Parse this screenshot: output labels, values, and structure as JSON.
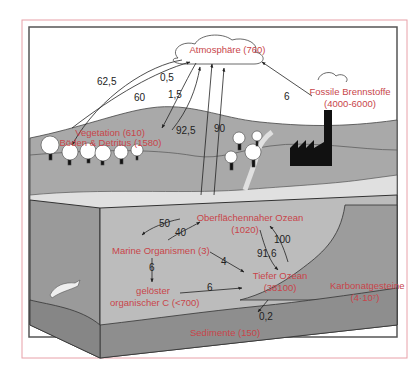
{
  "colors": {
    "reservoir_label": "#c8454a",
    "flux_label": "#222222",
    "outer_border": "#e8a0a8",
    "land": "#a9a9a9",
    "ocean_front": "#bcbcbc",
    "ocean_side": "#9a9a9a",
    "sediment": "#8e8e8e"
  },
  "reservoirs": {
    "atmosphere": "Atmosphäre (760)",
    "fossil_1": "Fossile Brennstoffe",
    "fossil_2": "(4000-6000)",
    "vegetation": "Vegetation (610)",
    "soil": "Böden & Detritus (1580)",
    "surface_ocean_1": "Oberflächennaher Ozean",
    "surface_ocean_2": "(1020)",
    "marine_organisms": "Marine Organismen (3)",
    "doc_1": "gelöster",
    "doc_2": "organischer C (<700)",
    "deep_ocean_1": "Tiefer Ozean",
    "deep_ocean_2": "(38100)",
    "carbonate_1": "Karbonatgesteine",
    "carbonate_2": "(4·10⁷)",
    "sediments": "Sedimente (150)"
  },
  "fluxes": {
    "veg_to_atm": "62,5",
    "atm_to_veg": "60",
    "f_05": "0,5",
    "f_15": "1,5",
    "ocean_to_atm": "92,5",
    "atm_to_ocean": "90",
    "fossil_to_atm": "6",
    "surface_to_marine": "50",
    "marine_to_surface": "40",
    "marine_to_doc": "6",
    "marine_to_deep": "4",
    "doc_to_deep": "6",
    "surface_to_deep": "91,6",
    "deep_to_surface": "100",
    "deep_to_sediment": "0,2"
  }
}
